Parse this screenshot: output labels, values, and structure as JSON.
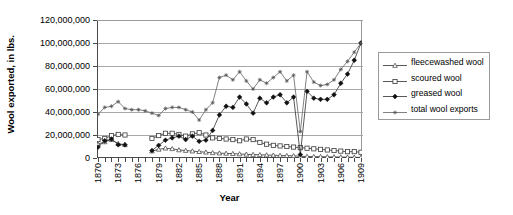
{
  "chart_data": {
    "type": "line",
    "title": "",
    "xlabel": "Year",
    "ylabel": "Wool exported, in lbs.",
    "xlim": [
      1870,
      1909
    ],
    "ylim": [
      0,
      120000000
    ],
    "grid": true,
    "legend_position": "right",
    "y_ticks": [
      0,
      20000000,
      40000000,
      60000000,
      80000000,
      100000000,
      120000000
    ],
    "y_tick_labels": [
      "0",
      "20,000,000",
      "40,000,000",
      "60,000,000",
      "80,000,000",
      "100,000,000",
      "120,000,000"
    ],
    "x": [
      1870,
      1871,
      1872,
      1873,
      1874,
      1875,
      1876,
      1877,
      1878,
      1879,
      1880,
      1881,
      1882,
      1883,
      1884,
      1885,
      1886,
      1887,
      1888,
      1889,
      1890,
      1891,
      1892,
      1893,
      1894,
      1895,
      1896,
      1897,
      1898,
      1899,
      1900,
      1901,
      1902,
      1903,
      1904,
      1905,
      1906,
      1907,
      1908,
      1909
    ],
    "x_tick_labels": [
      "1870",
      "1873",
      "1876",
      "1879",
      "1882",
      "1885",
      "1888",
      "1891",
      "1894",
      "1897",
      "1900",
      "1903",
      "1906",
      "1909"
    ],
    "series": [
      {
        "name": "fleecewashed wool",
        "marker": "triangle",
        "values": [
          12000000,
          14000000,
          16000000,
          12500000,
          11500000,
          null,
          null,
          null,
          6000000,
          7500000,
          8500000,
          8000000,
          7000000,
          6500000,
          6000000,
          5500000,
          5000000,
          4500000,
          4200000,
          4000000,
          3800000,
          3500000,
          3200000,
          3000000,
          2800000,
          2600000,
          2400000,
          2200000,
          2000000,
          1900000,
          1500000,
          1300000,
          1200000,
          1100000,
          1000000,
          900000,
          800000,
          700000,
          600000,
          500000
        ]
      },
      {
        "name": "scoured wool",
        "marker": "square-open",
        "values": [
          16000000,
          17000000,
          19500000,
          20500000,
          20000000,
          null,
          null,
          null,
          17000000,
          19500000,
          21500000,
          21500000,
          20500000,
          19000000,
          21000000,
          22000000,
          20000000,
          17500000,
          17000000,
          16500000,
          16000000,
          15000000,
          16500000,
          16000000,
          13500000,
          12000000,
          11000000,
          10500000,
          10000000,
          9500000,
          9000000,
          8500000,
          8000000,
          7500000,
          7000000,
          6500000,
          6000000,
          5500000,
          5500000,
          5000000
        ]
      },
      {
        "name": "greased wool",
        "marker": "diamond-filled",
        "values": [
          9500000,
          15000000,
          16500000,
          11500000,
          11500000,
          null,
          null,
          null,
          6500000,
          11000000,
          15500000,
          17500000,
          19000000,
          16000000,
          19000000,
          14500000,
          15500000,
          24000000,
          37500000,
          45000000,
          44000000,
          53000000,
          47000000,
          39000000,
          52000000,
          48000000,
          53000000,
          55000000,
          48000000,
          53000000,
          3000000,
          58000000,
          52000000,
          51000000,
          51000000,
          55000000,
          65000000,
          73000000,
          85000000,
          100000000
        ]
      },
      {
        "name": "total wool exports",
        "marker": "asterisk",
        "values": [
          38000000,
          44000000,
          45000000,
          49000000,
          43000000,
          42000000,
          42000000,
          41000000,
          39000000,
          37000000,
          43000000,
          44000000,
          44000000,
          42000000,
          40000000,
          33000000,
          42000000,
          48000000,
          70000000,
          72000000,
          68000000,
          75000000,
          67000000,
          60000000,
          68000000,
          65000000,
          70000000,
          75000000,
          67000000,
          72000000,
          23000000,
          75000000,
          66000000,
          63000000,
          64000000,
          68000000,
          77000000,
          84000000,
          92000000,
          100000000
        ]
      }
    ]
  },
  "legend": {
    "items": [
      {
        "label": "fleecewashed wool",
        "marker": "triangle"
      },
      {
        "label": "scoured wool",
        "marker": "square-open"
      },
      {
        "label": "greased wool",
        "marker": "diamond-filled"
      },
      {
        "label": "total wool exports",
        "marker": "asterisk"
      }
    ]
  },
  "colors": {
    "line": "#3a3a3a",
    "grid": "#a8a8a8",
    "axis": "#4a4a4a",
    "text": "#000000",
    "background": "#ffffff"
  }
}
